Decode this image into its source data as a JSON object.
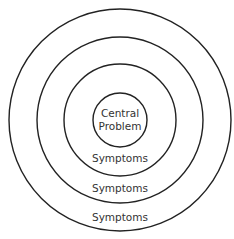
{
  "diagram": {
    "type": "concentric-circles",
    "stroke_color": "#222222",
    "text_color": "#333333",
    "center_label_line1": "Central",
    "center_label_line2": "Problem",
    "rings": [
      {
        "label": "Symptoms"
      },
      {
        "label": "Symptoms"
      },
      {
        "label": "Symptoms"
      }
    ],
    "cropped_top_text": "…page…"
  }
}
